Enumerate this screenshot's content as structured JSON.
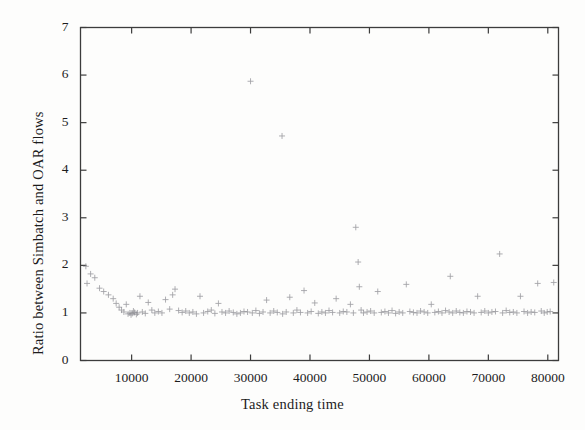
{
  "figure": {
    "background_color": "#fdfdfc",
    "frame_color": "#3c3c3c",
    "marker_color": "#8d8d92"
  },
  "chart_data": {
    "type": "scatter",
    "title": "",
    "xlabel": "Task ending time",
    "ylabel": "Ratio between Simbatch and OAR flows",
    "xlim": [
      1400,
      81800
    ],
    "ylim": [
      0,
      7
    ],
    "xticks": [
      10000,
      20000,
      30000,
      40000,
      50000,
      60000,
      70000,
      80000
    ],
    "xtick_labels": [
      "10000",
      "20000",
      "30000",
      "40000",
      "50000",
      "60000",
      "70000",
      "80000"
    ],
    "yticks": [
      0,
      1,
      2,
      3,
      4,
      5,
      6,
      7
    ],
    "ytick_labels": [
      "0",
      "1",
      "2",
      "3",
      "4",
      "5",
      "6",
      "7"
    ],
    "grid": false,
    "legend": null,
    "marker": "+",
    "series": [
      {
        "name": "Simbatch / OAR flow ratio",
        "points": [
          [
            2300,
            1.98
          ],
          [
            2500,
            1.62
          ],
          [
            3100,
            1.82
          ],
          [
            3800,
            1.74
          ],
          [
            4600,
            1.52
          ],
          [
            5300,
            1.45
          ],
          [
            6100,
            1.38
          ],
          [
            6900,
            1.3
          ],
          [
            7400,
            1.2
          ],
          [
            7900,
            1.12
          ],
          [
            8300,
            1.06
          ],
          [
            8700,
            1.02
          ],
          [
            9100,
            1.18
          ],
          [
            9400,
            0.98
          ],
          [
            9700,
            1.0
          ],
          [
            9900,
            0.96
          ],
          [
            10100,
            0.99
          ],
          [
            10300,
            1.04
          ],
          [
            10500,
            1.01
          ],
          [
            10800,
            0.97
          ],
          [
            11000,
            1.0
          ],
          [
            11400,
            1.35
          ],
          [
            11800,
            1.02
          ],
          [
            12300,
            0.99
          ],
          [
            12800,
            1.22
          ],
          [
            13400,
            1.06
          ],
          [
            13900,
            1.0
          ],
          [
            14500,
            1.03
          ],
          [
            15100,
            1.0
          ],
          [
            15700,
            1.28
          ],
          [
            16400,
            1.08
          ],
          [
            16900,
            1.38
          ],
          [
            17300,
            1.5
          ],
          [
            17900,
            1.05
          ],
          [
            18500,
            1.01
          ],
          [
            19100,
            1.04
          ],
          [
            19700,
            1.0
          ],
          [
            20300,
            1.02
          ],
          [
            20900,
            0.98
          ],
          [
            21500,
            1.35
          ],
          [
            22100,
            1.0
          ],
          [
            22800,
            1.03
          ],
          [
            23400,
            1.06
          ],
          [
            24000,
            0.99
          ],
          [
            24600,
            1.2
          ],
          [
            25200,
            1.02
          ],
          [
            25800,
            1.0
          ],
          [
            26400,
            1.04
          ],
          [
            27100,
            1.01
          ],
          [
            27700,
            0.98
          ],
          [
            28300,
            1.0
          ],
          [
            28900,
            1.03
          ],
          [
            29500,
            1.02
          ],
          [
            30000,
            5.87
          ],
          [
            30300,
            1.0
          ],
          [
            30900,
            1.05
          ],
          [
            31500,
            0.99
          ],
          [
            32100,
            1.02
          ],
          [
            32700,
            1.27
          ],
          [
            33300,
            1.0
          ],
          [
            33900,
            1.04
          ],
          [
            34500,
            1.01
          ],
          [
            35300,
            4.72
          ],
          [
            35400,
            0.98
          ],
          [
            36000,
            1.02
          ],
          [
            36600,
            1.33
          ],
          [
            37200,
            1.0
          ],
          [
            37800,
            1.06
          ],
          [
            38400,
            1.01
          ],
          [
            39000,
            1.47
          ],
          [
            39600,
            1.0
          ],
          [
            40200,
            1.03
          ],
          [
            40800,
            1.21
          ],
          [
            41400,
            0.99
          ],
          [
            42000,
            1.02
          ],
          [
            42600,
            1.0
          ],
          [
            43200,
            1.05
          ],
          [
            43800,
            1.01
          ],
          [
            44400,
            1.3
          ],
          [
            45000,
            1.0
          ],
          [
            45600,
            1.03
          ],
          [
            46200,
            1.02
          ],
          [
            46800,
            1.18
          ],
          [
            47300,
            1.0
          ],
          [
            47700,
            2.8
          ],
          [
            48100,
            2.07
          ],
          [
            48300,
            1.55
          ],
          [
            48600,
            1.06
          ],
          [
            49000,
            1.0
          ],
          [
            49600,
            1.02
          ],
          [
            50200,
            1.04
          ],
          [
            50800,
            1.0
          ],
          [
            51400,
            1.45
          ],
          [
            52000,
            1.01
          ],
          [
            52600,
            1.03
          ],
          [
            53200,
            1.0
          ],
          [
            53800,
            1.05
          ],
          [
            54400,
            0.99
          ],
          [
            55000,
            1.02
          ],
          [
            55600,
            1.0
          ],
          [
            56200,
            1.6
          ],
          [
            56800,
            1.03
          ],
          [
            57400,
            1.01
          ],
          [
            58000,
            1.0
          ],
          [
            58600,
            1.04
          ],
          [
            59200,
            1.02
          ],
          [
            59800,
            1.0
          ],
          [
            60400,
            1.18
          ],
          [
            61000,
            1.01
          ],
          [
            61600,
            1.03
          ],
          [
            62200,
            1.0
          ],
          [
            62800,
            1.05
          ],
          [
            63400,
            1.02
          ],
          [
            63600,
            1.77
          ],
          [
            64000,
            1.0
          ],
          [
            64600,
            1.04
          ],
          [
            65200,
            1.01
          ],
          [
            65800,
            1.0
          ],
          [
            66400,
            1.03
          ],
          [
            67000,
            1.02
          ],
          [
            67600,
            1.0
          ],
          [
            68200,
            1.35
          ],
          [
            68800,
            1.01
          ],
          [
            69400,
            1.04
          ],
          [
            70000,
            1.0
          ],
          [
            70600,
            1.02
          ],
          [
            71200,
            1.03
          ],
          [
            71900,
            2.24
          ],
          [
            72400,
            1.0
          ],
          [
            73000,
            1.05
          ],
          [
            73600,
            1.01
          ],
          [
            74200,
            1.02
          ],
          [
            74800,
            1.0
          ],
          [
            75400,
            1.35
          ],
          [
            76000,
            1.03
          ],
          [
            76600,
            1.0
          ],
          [
            77200,
            1.02
          ],
          [
            77800,
            1.01
          ],
          [
            78300,
            1.62
          ],
          [
            78900,
            1.04
          ],
          [
            79400,
            1.0
          ],
          [
            79900,
            1.02
          ],
          [
            80400,
            1.03
          ],
          [
            81000,
            1.64
          ]
        ]
      }
    ]
  }
}
